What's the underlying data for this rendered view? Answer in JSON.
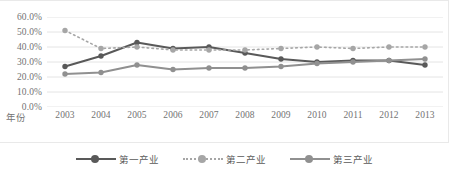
{
  "chart_data": {
    "type": "line",
    "title": "",
    "xlabel": "年份",
    "ylabel": "",
    "categories": [
      "2003",
      "2004",
      "2005",
      "2006",
      "2007",
      "2008",
      "2009",
      "2010",
      "2011",
      "2012",
      "2013"
    ],
    "ylim": [
      0,
      60
    ],
    "ytick_labels": [
      "0.0%",
      "10.0%",
      "20.0%",
      "30.0%",
      "40.0%",
      "50.0%",
      "60.0%"
    ],
    "ytick_values": [
      0,
      10,
      20,
      30,
      40,
      50,
      60
    ],
    "grid": true,
    "legend_position": "bottom",
    "series": [
      {
        "name": "第一产业",
        "style": "solid",
        "color": "#595959",
        "marker": "circle",
        "values": [
          27.0,
          34.0,
          43.0,
          39.0,
          40.0,
          36.0,
          32.0,
          30.0,
          31.0,
          31.0,
          28.0
        ]
      },
      {
        "name": "第二产业",
        "style": "dotted",
        "color": "#a6a6a6",
        "marker": "circle",
        "values": [
          51.0,
          39.0,
          40.0,
          38.0,
          38.0,
          38.0,
          39.0,
          40.0,
          39.0,
          40.0,
          40.0
        ]
      },
      {
        "name": "第三产业",
        "style": "solid",
        "color": "#909090",
        "marker": "circle",
        "values": [
          22.0,
          23.0,
          28.0,
          25.0,
          26.0,
          26.0,
          27.0,
          29.0,
          30.0,
          31.0,
          32.0
        ]
      }
    ]
  }
}
